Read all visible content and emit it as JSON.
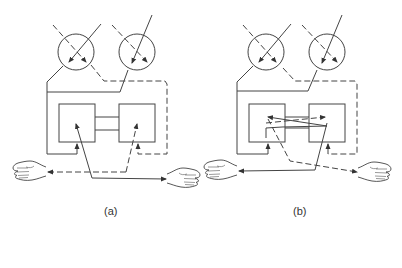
{
  "diagram": {
    "type": "teleoperation-control-schematic",
    "line_color": "#444444",
    "background": "#ffffff",
    "legend": {
      "solid_line": "signal path A",
      "dashed_line": "signal path B"
    },
    "panels": [
      {
        "id": "a",
        "caption": "(a)",
        "offset_x": 0,
        "elements": [
          "sensor-circle-left",
          "sensor-circle-right",
          "left-box",
          "right-box",
          "coupling-rails",
          "left-hand",
          "right-hand"
        ],
        "description": "straight coupling: left box drives right hand (solid), right box drives left hand (dashed)"
      },
      {
        "id": "b",
        "caption": "(b)",
        "offset_x": 190,
        "elements": [
          "sensor-circle-left",
          "sensor-circle-right",
          "left-box",
          "right-box",
          "coupling-rails",
          "cross-arrows",
          "left-hand",
          "right-hand"
        ],
        "description": "crossed coupling: signals cross between boxes; right box drives left hand (solid), left box drives right hand (dashed)"
      }
    ]
  }
}
